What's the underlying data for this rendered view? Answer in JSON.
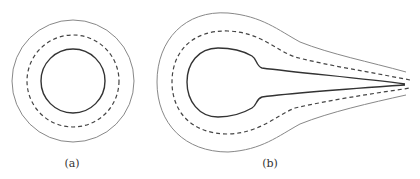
{
  "figure": {
    "panels": [
      {
        "id": "a",
        "label": "(a)",
        "description": "concentric circular contours: inner solid, middle dashed, outer thin"
      },
      {
        "id": "b",
        "label": "(b)",
        "description": "teardrop contours with a tail tapering to the right: inner solid, middle dashed, outer thin"
      }
    ],
    "colors": {
      "inner_stroke": "#333333",
      "dashed_stroke": "#444444",
      "outer_stroke": "#888888",
      "background": "#ffffff"
    }
  }
}
